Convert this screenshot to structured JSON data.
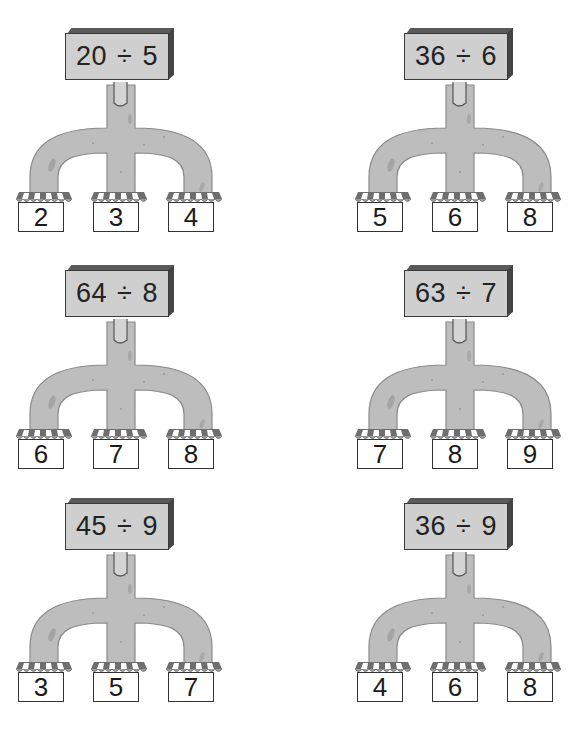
{
  "worksheet": {
    "colors": {
      "branch_fill": "#bdbdbd",
      "branch_stroke": "#8a8a8a",
      "sign_fill": "#cfcfcf",
      "awning_dark": "#6e6e6e",
      "awning_light": "#ffffff"
    },
    "puzzles": [
      {
        "id": "p1",
        "dividend": "20",
        "operator": "÷",
        "divisor": "5",
        "expression": "20 ÷ 5",
        "options": [
          "2",
          "3",
          "4"
        ],
        "pos": {
          "left": 14,
          "top": 27
        }
      },
      {
        "id": "p2",
        "dividend": "36",
        "operator": "÷",
        "divisor": "6",
        "expression": "36 ÷ 6",
        "options": [
          "5",
          "6",
          "8"
        ],
        "pos": {
          "left": 353,
          "top": 27
        }
      },
      {
        "id": "p3",
        "dividend": "64",
        "operator": "÷",
        "divisor": "8",
        "expression": "64 ÷ 8",
        "options": [
          "6",
          "7",
          "8"
        ],
        "pos": {
          "left": 14,
          "top": 264
        }
      },
      {
        "id": "p4",
        "dividend": "63",
        "operator": "÷",
        "divisor": "7",
        "expression": "63 ÷ 7",
        "options": [
          "7",
          "8",
          "9"
        ],
        "pos": {
          "left": 353,
          "top": 264
        }
      },
      {
        "id": "p5",
        "dividend": "45",
        "operator": "÷",
        "divisor": "9",
        "expression": "45 ÷ 9",
        "options": [
          "3",
          "5",
          "7"
        ],
        "pos": {
          "left": 14,
          "top": 497
        }
      },
      {
        "id": "p6",
        "dividend": "36",
        "operator": "÷",
        "divisor": "9",
        "expression": "36 ÷ 9",
        "options": [
          "4",
          "6",
          "8"
        ],
        "pos": {
          "left": 353,
          "top": 497
        }
      }
    ]
  }
}
